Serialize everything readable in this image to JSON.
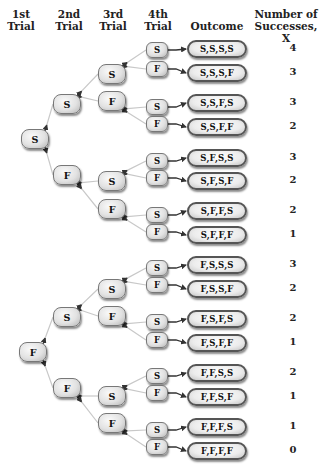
{
  "headers": {
    "trial1": [
      "1st",
      "Trial"
    ],
    "trial2": [
      "2nd",
      "Trial"
    ],
    "trial3": [
      "3rd",
      "Trial"
    ],
    "trial4": [
      "4th",
      "Trial"
    ],
    "outcome": [
      "Outcome"
    ],
    "successes": [
      "Number of",
      "Successes, X"
    ]
  },
  "tree": {
    "trial1": [
      {
        "label": "S",
        "x": 35,
        "y": 139
      },
      {
        "label": "F",
        "x": 33,
        "y": 352
      }
    ],
    "trial2": [
      {
        "label": "S",
        "x": 67,
        "y": 104,
        "parent": 0
      },
      {
        "label": "F",
        "x": 67,
        "y": 175,
        "parent": 0
      },
      {
        "label": "S",
        "x": 67,
        "y": 317,
        "parent": 1
      },
      {
        "label": "F",
        "x": 67,
        "y": 388,
        "parent": 1
      }
    ],
    "trial3": [
      {
        "label": "S",
        "x": 112,
        "y": 74,
        "parent": 0
      },
      {
        "label": "F",
        "x": 112,
        "y": 101,
        "parent": 0
      },
      {
        "label": "S",
        "x": 112,
        "y": 181,
        "parent": 1
      },
      {
        "label": "F",
        "x": 112,
        "y": 209,
        "parent": 1
      },
      {
        "label": "S",
        "x": 112,
        "y": 289,
        "parent": 2
      },
      {
        "label": "F",
        "x": 112,
        "y": 316,
        "parent": 2
      },
      {
        "label": "S",
        "x": 112,
        "y": 396,
        "parent": 3
      },
      {
        "label": "F",
        "x": 112,
        "y": 423,
        "parent": 3
      }
    ],
    "trial4": [
      {
        "label": "S",
        "x": 157,
        "y": 50,
        "parent": 0
      },
      {
        "label": "F",
        "x": 157,
        "y": 69,
        "parent": 0
      },
      {
        "label": "S",
        "x": 157,
        "y": 107,
        "parent": 1
      },
      {
        "label": "F",
        "x": 157,
        "y": 124,
        "parent": 1
      },
      {
        "label": "S",
        "x": 157,
        "y": 161,
        "parent": 2
      },
      {
        "label": "F",
        "x": 157,
        "y": 178,
        "parent": 2
      },
      {
        "label": "S",
        "x": 157,
        "y": 215,
        "parent": 3
      },
      {
        "label": "F",
        "x": 157,
        "y": 232,
        "parent": 3
      },
      {
        "label": "S",
        "x": 157,
        "y": 268,
        "parent": 4
      },
      {
        "label": "F",
        "x": 157,
        "y": 285,
        "parent": 4
      },
      {
        "label": "S",
        "x": 157,
        "y": 322,
        "parent": 5
      },
      {
        "label": "F",
        "x": 157,
        "y": 340,
        "parent": 5
      },
      {
        "label": "S",
        "x": 157,
        "y": 376,
        "parent": 6
      },
      {
        "label": "F",
        "x": 157,
        "y": 393,
        "parent": 6
      },
      {
        "label": "S",
        "x": 157,
        "y": 430,
        "parent": 7
      },
      {
        "label": "F",
        "x": 157,
        "y": 447,
        "parent": 7
      }
    ]
  },
  "outcomes": [
    {
      "outcome": "S,S,S,S",
      "x": 4,
      "y": 49
    },
    {
      "outcome": "S,S,S,F",
      "x": 3,
      "y": 73
    },
    {
      "outcome": "S,S,F,S",
      "x": 3,
      "y": 103
    },
    {
      "outcome": "S,S,F,F",
      "x": 2,
      "y": 127
    },
    {
      "outcome": "S,F,S,S",
      "x": 3,
      "y": 158
    },
    {
      "outcome": "S,F,S,F",
      "x": 2,
      "y": 181
    },
    {
      "outcome": "S,F,F,S",
      "x": 2,
      "y": 211
    },
    {
      "outcome": "S,F,F,F",
      "x": 1,
      "y": 235
    },
    {
      "outcome": "F,S,S,S",
      "x": 3,
      "y": 265
    },
    {
      "outcome": "F,S,S,F",
      "x": 2,
      "y": 289
    },
    {
      "outcome": "F,S,F,S",
      "x": 2,
      "y": 319
    },
    {
      "outcome": "F,S,F,F",
      "x": 1,
      "y": 343
    },
    {
      "outcome": "F,F,S,S",
      "x": 2,
      "y": 373
    },
    {
      "outcome": "F,F,S,F",
      "x": 1,
      "y": 397
    },
    {
      "outcome": "F,F,F,S",
      "x": 1,
      "y": 427
    },
    {
      "outcome": "F,F,F,F",
      "x": 0,
      "y": 451
    }
  ],
  "colors": {
    "line": "#c8c8c8",
    "arrow": "#333333"
  }
}
